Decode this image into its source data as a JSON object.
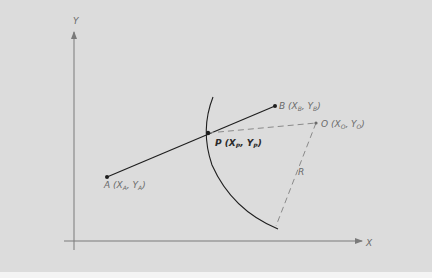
{
  "diagram": {
    "axes": {
      "x_label": "X",
      "y_label": "Y"
    },
    "points": {
      "A": {
        "name": "A",
        "x_sym": "X",
        "x_sub": "A",
        "y_sym": "Y",
        "y_sub": "A"
      },
      "B": {
        "name": "B",
        "x_sym": "X",
        "x_sub": "B",
        "y_sym": "Y",
        "y_sub": "B"
      },
      "P": {
        "name": "P",
        "x_sym": "X",
        "x_sub": "P",
        "y_sym": "Y",
        "y_sub": "P"
      },
      "O": {
        "name": "O",
        "x_sym": "X",
        "x_sub": "O",
        "y_sym": "Y",
        "y_sub": "O"
      }
    },
    "radius_label": "R",
    "colors": {
      "background": "#dcdcdc",
      "axis": "#7a7a7a",
      "segment": "#1e1e1e",
      "dashed": "#8a8a8a",
      "label": "#6a6a6a"
    }
  }
}
